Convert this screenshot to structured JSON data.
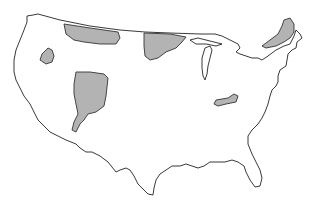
{
  "map": {
    "subject": "Contiguous United States",
    "fill_colors": {
      "land": "#ffffff",
      "highlighted_region": "#b3b3b3",
      "border": "#222222"
    },
    "highlighted_regions": [
      {
        "id": "northern-plains-region",
        "description": "Shaded area along northern border, Montana"
      },
      {
        "id": "idaho-region",
        "description": "Small shaded area in Idaho"
      },
      {
        "id": "colorado-plateau-region",
        "description": "Shaded area in Utah/Colorado"
      },
      {
        "id": "upper-midwest-region",
        "description": "Shaded area in Minnesota/Wisconsin"
      },
      {
        "id": "appalachian-region",
        "description": "Small shaded area in Kentucky/Virginia"
      },
      {
        "id": "northeast-region",
        "description": "Shaded area in New England/upstate New York"
      }
    ]
  }
}
